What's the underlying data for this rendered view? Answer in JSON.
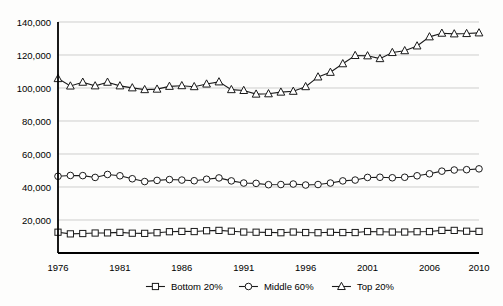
{
  "chart_data": {
    "type": "line",
    "title": "",
    "subtitle": "",
    "xlabel": "",
    "ylabel": "",
    "xlim": [
      1976,
      2010
    ],
    "ylim": [
      0,
      140000
    ],
    "grid": true,
    "legend_position": "bottom",
    "x_tick_labels": [
      "1976",
      "1981",
      "1986",
      "1991",
      "1996",
      "2001",
      "2006",
      "2010"
    ],
    "x_ticks": [
      1976,
      1981,
      1986,
      1991,
      1996,
      2001,
      2006,
      2010
    ],
    "y_tick_labels": [
      "20,000",
      "40,000",
      "60,000",
      "80,000",
      "100,000",
      "120,000",
      "140,000"
    ],
    "y_ticks": [
      20000,
      40000,
      60000,
      80000,
      100000,
      120000,
      140000
    ],
    "x": [
      1976,
      1977,
      1978,
      1979,
      1980,
      1981,
      1982,
      1983,
      1984,
      1985,
      1986,
      1987,
      1988,
      1989,
      1990,
      1991,
      1992,
      1993,
      1994,
      1995,
      1996,
      1997,
      1998,
      1999,
      2000,
      2001,
      2002,
      2003,
      2004,
      2005,
      2006,
      2007,
      2008,
      2009,
      2010
    ],
    "series": [
      {
        "name": "Bottom 20%",
        "marker": "square",
        "values": [
          12600,
          11600,
          11800,
          12100,
          12200,
          12500,
          12000,
          11900,
          12300,
          12900,
          13100,
          13000,
          13500,
          13700,
          13200,
          12700,
          12600,
          12500,
          12300,
          12700,
          12400,
          12300,
          12600,
          12400,
          12400,
          13000,
          12900,
          12700,
          12700,
          12900,
          13000,
          13700,
          13700,
          13200,
          13100
        ]
      },
      {
        "name": "Middle 60%",
        "marker": "circle",
        "values": [
          46500,
          47000,
          46900,
          45800,
          47600,
          46800,
          45000,
          43300,
          44000,
          44500,
          44200,
          43800,
          44700,
          45500,
          43700,
          42400,
          42200,
          41400,
          41500,
          41800,
          41200,
          41500,
          42400,
          43700,
          44200,
          45800,
          45900,
          45600,
          45900,
          46800,
          48000,
          49600,
          50300,
          50500,
          51000
        ]
      },
      {
        "name": "Top 20%",
        "marker": "triangle",
        "values": [
          105700,
          101200,
          103500,
          101300,
          103500,
          101300,
          100100,
          99000,
          99300,
          101000,
          101400,
          100800,
          102400,
          103700,
          99000,
          98500,
          96300,
          96500,
          97500,
          98000,
          100800,
          106700,
          109500,
          114700,
          119700,
          119500,
          117800,
          121500,
          122600,
          125500,
          131000,
          133200,
          132800,
          133000,
          133400
        ]
      }
    ]
  },
  "legend": {
    "items": [
      {
        "label": "Bottom 20%",
        "marker": "square"
      },
      {
        "label": "Middle 60%",
        "marker": "circle"
      },
      {
        "label": "Top 20%",
        "marker": "triangle"
      }
    ]
  },
  "colors": {
    "line": "#1a1a1a",
    "grid": "#b9b9b9",
    "axis": "#000000",
    "marker_fill": "#ffffff",
    "background": "#fdfdfc"
  }
}
